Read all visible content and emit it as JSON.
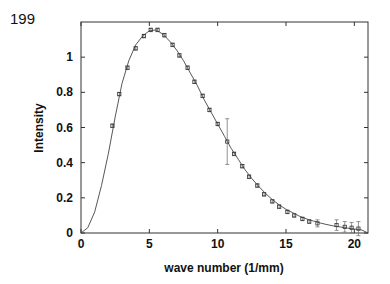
{
  "figure_label": "199",
  "chart_data": {
    "type": "line",
    "title": "",
    "xlabel": "wave number (1/mm)",
    "ylabel": "Intensity",
    "xlim": [
      0,
      21
    ],
    "ylim": [
      0,
      1.2
    ],
    "grid": false,
    "legend": null,
    "x_ticks": [
      0,
      5,
      10,
      15,
      20
    ],
    "x_tick_labels": [
      "0",
      "5",
      "10",
      "15",
      "20"
    ],
    "y_ticks": [
      0,
      0.2,
      0.4,
      0.6,
      0.8,
      1
    ],
    "y_tick_labels": [
      "0",
      "0.2",
      "0.4",
      "0.6",
      "0.8",
      "1"
    ],
    "series": [
      {
        "name": "measured",
        "style": "points-with-errorbars",
        "x": [
          2.3,
          2.8,
          3.4,
          4.0,
          4.6,
          5.1,
          5.6,
          6.1,
          6.7,
          7.2,
          7.8,
          8.3,
          8.9,
          9.4,
          10.0,
          10.7,
          11.2,
          11.8,
          12.3,
          12.9,
          13.4,
          14.0,
          14.5,
          15.1,
          15.6,
          16.2,
          16.7,
          17.3,
          18.7,
          19.3,
          19.8,
          20.3
        ],
        "y": [
          0.61,
          0.79,
          0.94,
          1.05,
          1.12,
          1.155,
          1.155,
          1.125,
          1.07,
          1.01,
          0.94,
          0.86,
          0.78,
          0.7,
          0.62,
          0.52,
          0.45,
          0.38,
          0.32,
          0.27,
          0.22,
          0.18,
          0.15,
          0.12,
          0.1,
          0.08,
          0.065,
          0.055,
          0.045,
          0.035,
          0.03,
          0.025
        ],
        "err": [
          0.01,
          0.01,
          0.01,
          0.01,
          0.01,
          0.01,
          0.01,
          0.01,
          0.01,
          0.01,
          0.01,
          0.01,
          0.01,
          0.01,
          0.01,
          0.13,
          0.01,
          0.01,
          0.01,
          0.01,
          0.01,
          0.01,
          0.01,
          0.01,
          0.01,
          0.01,
          0.01,
          0.02,
          0.03,
          0.03,
          0.03,
          0.04
        ]
      },
      {
        "name": "fit",
        "style": "line",
        "x": [
          0,
          0.5,
          1,
          1.5,
          2,
          2.5,
          3,
          3.5,
          4,
          4.5,
          5,
          5.5,
          6,
          6.5,
          7,
          7.5,
          8,
          8.5,
          9,
          9.5,
          10,
          10.5,
          11,
          11.5,
          12,
          12.5,
          13,
          13.5,
          14,
          14.5,
          15,
          15.5,
          16,
          16.5,
          17,
          17.5,
          18,
          18.5,
          19,
          19.5,
          20,
          20.5,
          21
        ],
        "y": [
          0,
          0.03,
          0.12,
          0.27,
          0.45,
          0.66,
          0.85,
          0.98,
          1.07,
          1.12,
          1.15,
          1.155,
          1.13,
          1.09,
          1.04,
          0.98,
          0.91,
          0.84,
          0.76,
          0.69,
          0.62,
          0.55,
          0.48,
          0.42,
          0.36,
          0.31,
          0.265,
          0.225,
          0.19,
          0.16,
          0.135,
          0.115,
          0.095,
          0.08,
          0.068,
          0.057,
          0.048,
          0.04,
          0.034,
          0.028,
          0.023,
          0.018,
          0.0
        ]
      }
    ]
  }
}
